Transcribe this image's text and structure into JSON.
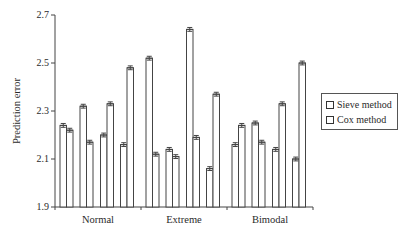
{
  "chart_data": {
    "type": "bar",
    "title": "",
    "xlabel": "",
    "ylabel": "Prediction error",
    "ylim": [
      1.9,
      2.7
    ],
    "yticks": [
      "1.9",
      "2.1",
      "2.3",
      "2.5",
      "2.7"
    ],
    "grid": false,
    "legend_position": "right",
    "categories": [
      "Normal",
      "Extreme",
      "Bimodal"
    ],
    "subgroups_per_category": 4,
    "error_bars": true,
    "series": [
      {
        "name": "Sieve method",
        "values": [
          [
            2.24,
            2.32,
            2.2,
            2.16
          ],
          [
            2.52,
            2.14,
            2.64,
            2.06
          ],
          [
            2.16,
            2.25,
            2.14,
            2.1
          ]
        ]
      },
      {
        "name": "Cox method",
        "values": [
          [
            2.22,
            2.17,
            2.33,
            2.48
          ],
          [
            2.12,
            2.11,
            2.19,
            2.37
          ],
          [
            2.24,
            2.17,
            2.33,
            2.5
          ]
        ]
      }
    ],
    "error_half_width": 0.008
  },
  "legend": {
    "items": [
      {
        "label": "Sieve method"
      },
      {
        "label": "Cox method"
      }
    ]
  },
  "axis": {
    "ylabel": "Prediction error"
  }
}
